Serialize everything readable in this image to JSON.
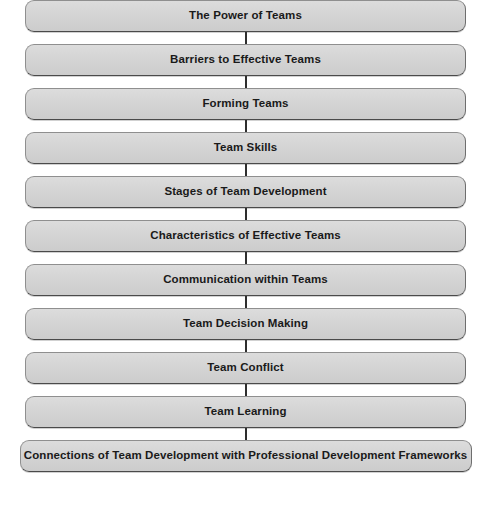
{
  "diagram": {
    "type": "vertical-flowchart",
    "title": "",
    "orientation": "top-to-bottom",
    "node_count": 11,
    "connector": "vertical-line",
    "colors": {
      "node_fill": "#d3d3d3",
      "node_border": "#8f8f8f",
      "node_text": "#1a1a1a",
      "connector": "#2e2e2e",
      "background": "#ffffff"
    },
    "nodes": [
      {
        "label": "The Power of Teams"
      },
      {
        "label": "Barriers to Effective Teams"
      },
      {
        "label": "Forming Teams"
      },
      {
        "label": "Team Skills"
      },
      {
        "label": "Stages of Team Development"
      },
      {
        "label": "Characteristics of Effective Teams"
      },
      {
        "label": "Communication within Teams"
      },
      {
        "label": "Team Decision Making"
      },
      {
        "label": "Team Conflict"
      },
      {
        "label": "Team Learning"
      },
      {
        "label": "Connections of Team Development with Professional Development Frameworks"
      }
    ]
  }
}
